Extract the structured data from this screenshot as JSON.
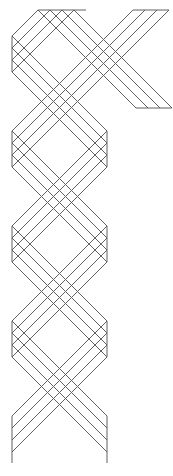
{
  "canvas": {
    "width": 173,
    "height": 476,
    "background": "#ffffff"
  },
  "drawing": {
    "name": "interlaced-ribbon-braid-pattern",
    "stroke_color": "#616161",
    "stroke_width": 1,
    "strands": [
      {
        "name": "strand-a",
        "description": "long strand: enters from right arm, folds at top edge, zigzags left-right-left-right, ends at bottom-left cut",
        "lines": [
          [
            [
              136,
              108
            ],
            [
              38,
              10
            ],
            [
              12,
              36
            ],
            [
              107,
              131
            ],
            [
              12,
              226
            ],
            [
              107,
              321
            ],
            [
              12,
              416
            ]
          ],
          [
            [
              148,
              108
            ],
            [
              50,
              10
            ],
            [
              12,
              48
            ],
            [
              107,
              143
            ],
            [
              12,
              238
            ],
            [
              107,
              333
            ],
            [
              12,
              428
            ]
          ],
          [
            [
              160,
              108
            ],
            [
              62,
              10
            ],
            [
              12,
              60
            ],
            [
              107,
              155
            ],
            [
              12,
              250
            ],
            [
              107,
              345
            ],
            [
              12,
              440
            ]
          ],
          [
            [
              172,
              108
            ],
            [
              74,
              10
            ],
            [
              12,
              72
            ],
            [
              107,
              167
            ],
            [
              12,
              262
            ],
            [
              107,
              357
            ],
            [
              12,
              452
            ]
          ]
        ]
      },
      {
        "name": "strand-b",
        "description": "strand entering at top-right cut, zigzags left-right-left, ends at bottom-right cut",
        "lines": [
          [
            [
              133,
              10
            ],
            [
              12,
              131
            ],
            [
              107,
              226
            ],
            [
              12,
              321
            ],
            [
              107,
              416
            ]
          ],
          [
            [
              145,
              10
            ],
            [
              12,
              143
            ],
            [
              107,
              238
            ],
            [
              12,
              333
            ],
            [
              107,
              428
            ]
          ],
          [
            [
              157,
              10
            ],
            [
              12,
              155
            ],
            [
              107,
              250
            ],
            [
              12,
              345
            ],
            [
              107,
              440
            ]
          ],
          [
            [
              169,
              10
            ],
            [
              12,
              167
            ],
            [
              107,
              262
            ],
            [
              12,
              357
            ],
            [
              107,
              452
            ]
          ]
        ]
      }
    ],
    "edges": [
      {
        "name": "top-fold-edge",
        "points": [
          [
            38,
            10
          ],
          [
            86,
            10
          ]
        ]
      },
      {
        "name": "strand-b-start-cut",
        "points": [
          [
            133,
            10
          ],
          [
            169,
            10
          ]
        ]
      },
      {
        "name": "right-arm-end-cut",
        "points": [
          [
            136,
            108
          ],
          [
            172,
            108
          ]
        ]
      },
      {
        "name": "left-fold-edge-1",
        "points": [
          [
            12,
            36
          ],
          [
            12,
            72
          ]
        ]
      },
      {
        "name": "left-fold-edge-2",
        "points": [
          [
            12,
            131
          ],
          [
            12,
            167
          ]
        ]
      },
      {
        "name": "left-fold-edge-3",
        "points": [
          [
            12,
            226
          ],
          [
            12,
            262
          ]
        ]
      },
      {
        "name": "left-fold-edge-4",
        "points": [
          [
            12,
            321
          ],
          [
            12,
            357
          ]
        ]
      },
      {
        "name": "right-fold-edge-1",
        "points": [
          [
            107,
            131
          ],
          [
            107,
            167
          ]
        ]
      },
      {
        "name": "right-fold-edge-2",
        "points": [
          [
            107,
            226
          ],
          [
            107,
            262
          ]
        ]
      },
      {
        "name": "right-fold-edge-3",
        "points": [
          [
            107,
            321
          ],
          [
            107,
            357
          ]
        ]
      },
      {
        "name": "bottom-left-end-cut",
        "points": [
          [
            12,
            416
          ],
          [
            12,
            463
          ]
        ]
      },
      {
        "name": "bottom-right-end-cut",
        "points": [
          [
            107,
            416
          ],
          [
            107,
            463
          ]
        ]
      }
    ]
  }
}
